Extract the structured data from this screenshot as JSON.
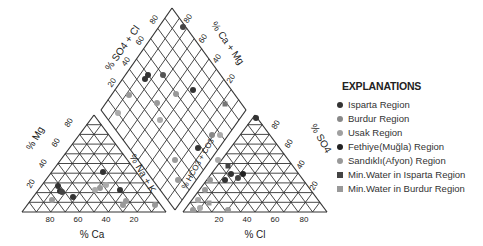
{
  "diagram": {
    "type": "piper",
    "cation_triangle": {
      "axis_bottom_label": "% Ca",
      "axis_left_label": "% Mg",
      "bottom_ticks": [
        "80",
        "60",
        "40",
        "20"
      ],
      "left_ticks": [
        "20",
        "40",
        "60",
        "80"
      ],
      "right_ticks": [
        "20",
        "40",
        "60",
        "80"
      ]
    },
    "anion_triangle": {
      "axis_bottom_label": "% Cl",
      "axis_right_label": "% SO4",
      "bottom_ticks": [
        "20",
        "40",
        "60",
        "80"
      ],
      "right_ticks": [
        "20",
        "40",
        "60",
        "80"
      ],
      "left_ticks": [
        "20",
        "40",
        "60",
        "80"
      ]
    },
    "diamond": {
      "label_upper_left": "% SO4 + Cl",
      "label_upper_right": "% Ca + Mg",
      "label_lower_left": "% Na + K",
      "label_lower_right": "% HCO3 + CO3",
      "upper_left_ticks": [
        "20",
        "40",
        "60",
        "80"
      ],
      "upper_right_ticks": [
        "20",
        "40",
        "60",
        "80"
      ]
    }
  },
  "legend": {
    "title": "EXPLANATIONS",
    "items": [
      {
        "label": "Isparta Region",
        "shape": "circle",
        "color": "#333333"
      },
      {
        "label": "Burdur Region",
        "shape": "circle",
        "color": "#888888"
      },
      {
        "label": "Usak Region",
        "shape": "circle",
        "color": "#a0a0a0"
      },
      {
        "label": "Fethiye(Muğla) Region",
        "shape": "circle",
        "color": "#222222"
      },
      {
        "label": "Sandıklı(Afyon) Region",
        "shape": "circle",
        "color": "#999999"
      },
      {
        "label": "Min.Water in Isparta Region",
        "shape": "square",
        "color": "#444444"
      },
      {
        "label": "Min.Water in Burdur Region",
        "shape": "square",
        "color": "#999999"
      }
    ]
  }
}
